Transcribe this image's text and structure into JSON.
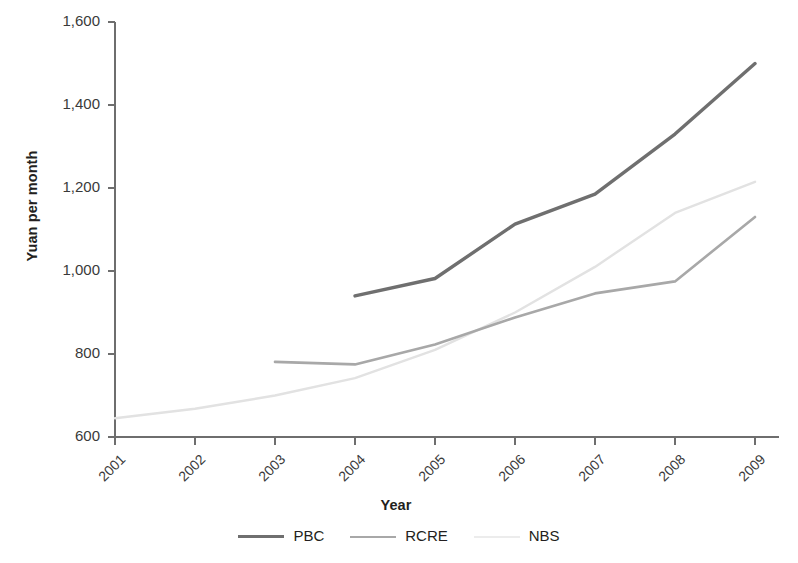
{
  "chart_data": {
    "type": "line",
    "title": "",
    "xlabel": "Year",
    "ylabel": "Yuan per month",
    "x": [
      2001,
      2002,
      2003,
      2004,
      2005,
      2006,
      2007,
      2008,
      2009
    ],
    "xticklabels": [
      "2001",
      "2002",
      "2003",
      "2004",
      "2005",
      "2006",
      "2007",
      "2008",
      "2009"
    ],
    "yticks": [
      600,
      800,
      1000,
      1200,
      1400,
      1600
    ],
    "yticklabels": [
      "600",
      "800",
      "1,000",
      "1,200",
      "1,400",
      "1,600"
    ],
    "ylim": [
      600,
      1600
    ],
    "xlim": [
      2001,
      2009
    ],
    "grid": false,
    "legend_position": "bottom-center",
    "series": [
      {
        "name": "PBC",
        "color": "#6f6f6f",
        "width": 3.4,
        "x": [
          2004,
          2005,
          2006,
          2007,
          2008,
          2009
        ],
        "values": [
          940,
          982,
          1113,
          1185,
          1330,
          1500
        ]
      },
      {
        "name": "RCRE",
        "color": "#a8a8a8",
        "width": 2.6,
        "x": [
          2003,
          2004,
          2005,
          2006,
          2007,
          2008,
          2009
        ],
        "values": [
          781,
          775,
          823,
          888,
          946,
          975,
          1130
        ]
      },
      {
        "name": "NBS",
        "color": "#e2e2e2",
        "width": 2.4,
        "x": [
          2001,
          2002,
          2003,
          2004,
          2005,
          2006,
          2007,
          2008,
          2009
        ],
        "values": [
          645,
          668,
          700,
          742,
          810,
          900,
          1010,
          1140,
          1215
        ]
      }
    ]
  },
  "legend": {
    "items": [
      {
        "label": "PBC",
        "color": "#6f6f6f",
        "width": 3.4
      },
      {
        "label": "RCRE",
        "color": "#a8a8a8",
        "width": 2.6
      },
      {
        "label": "NBS",
        "color": "#ececec",
        "width": 2.4
      }
    ]
  },
  "axes": {
    "axis_color": "#6e6e6e",
    "tick_color": "#6e6e6e"
  }
}
